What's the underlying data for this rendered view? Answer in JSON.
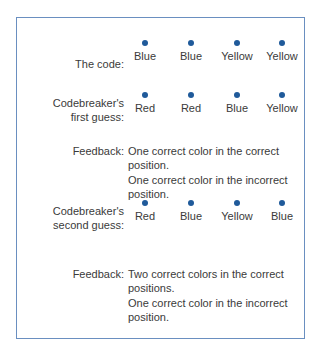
{
  "colors": {
    "border": "#6a8fc0",
    "dot": "#1f5a9a",
    "text": "#3a3a3a"
  },
  "code": {
    "label": "The code:",
    "pegs": [
      "Blue",
      "Blue",
      "Yellow",
      "Yellow"
    ]
  },
  "guess1": {
    "label_line1": "Codebreaker's",
    "label_line2": "first guess:",
    "pegs": [
      "Red",
      "Red",
      "Blue",
      "Yellow"
    ],
    "feedback_label": "Feedback:",
    "feedback": [
      "One correct color in the correct position.",
      "One correct color in the incorrect position."
    ]
  },
  "guess2": {
    "label_line1": "Codebreaker's",
    "label_line2": "second guess:",
    "pegs": [
      "Red",
      "Blue",
      "Yellow",
      "Blue"
    ],
    "feedback_label": "Feedback:",
    "feedback": [
      "Two correct colors in the correct positions.",
      "One correct color in the incorrect position."
    ]
  }
}
